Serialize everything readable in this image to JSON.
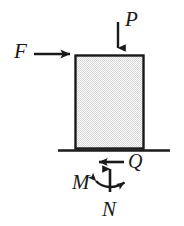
{
  "figure": {
    "kind": "free-body-diagram",
    "background_color": "#ffffff",
    "stroke_color": "#1a1a1a",
    "body": {
      "shape": "rectangle",
      "fill_pattern": "stipple",
      "fill_color": "#d9d9d9",
      "fill_base": "#ffffff",
      "outline_color": "#1a1a1a"
    },
    "ground": {
      "name": "ground-line",
      "color": "#1a1a1a"
    }
  },
  "loads": [
    {
      "symbol": "P",
      "name": "vertical-load-p",
      "direction": "down",
      "applied_at": "top-face"
    },
    {
      "symbol": "F",
      "name": "horizontal-load-f",
      "direction": "right",
      "applied_at": "top-left-corner"
    }
  ],
  "reactions": [
    {
      "symbol": "Q",
      "name": "shear-reaction-q",
      "direction": "left",
      "applied_at": "base"
    },
    {
      "symbol": "N",
      "name": "normal-reaction-n",
      "direction": "up",
      "applied_at": "base"
    },
    {
      "symbol": "M",
      "name": "moment-reaction-m",
      "direction": "curved-double-headed",
      "applied_at": "base"
    }
  ],
  "labels": {
    "p": "P",
    "f": "F",
    "q": "Q",
    "n": "N",
    "m": "M"
  }
}
